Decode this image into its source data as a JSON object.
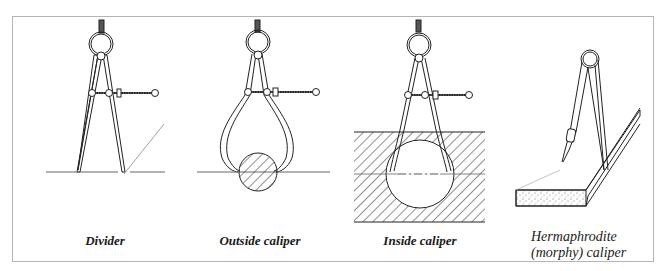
{
  "figure": {
    "colors": {
      "line": "#222222",
      "frame": "#b5b5b5",
      "background": "#ffffff"
    },
    "panels": [
      {
        "id": "divider",
        "label": "Divider"
      },
      {
        "id": "outside-caliper",
        "label": "Outside caliper"
      },
      {
        "id": "inside-caliper",
        "label": "Inside caliper"
      },
      {
        "id": "hermaphrodite-caliper",
        "label_line1": "Hermaphrodite",
        "label_line2": "(morphy) caliper"
      }
    ]
  }
}
